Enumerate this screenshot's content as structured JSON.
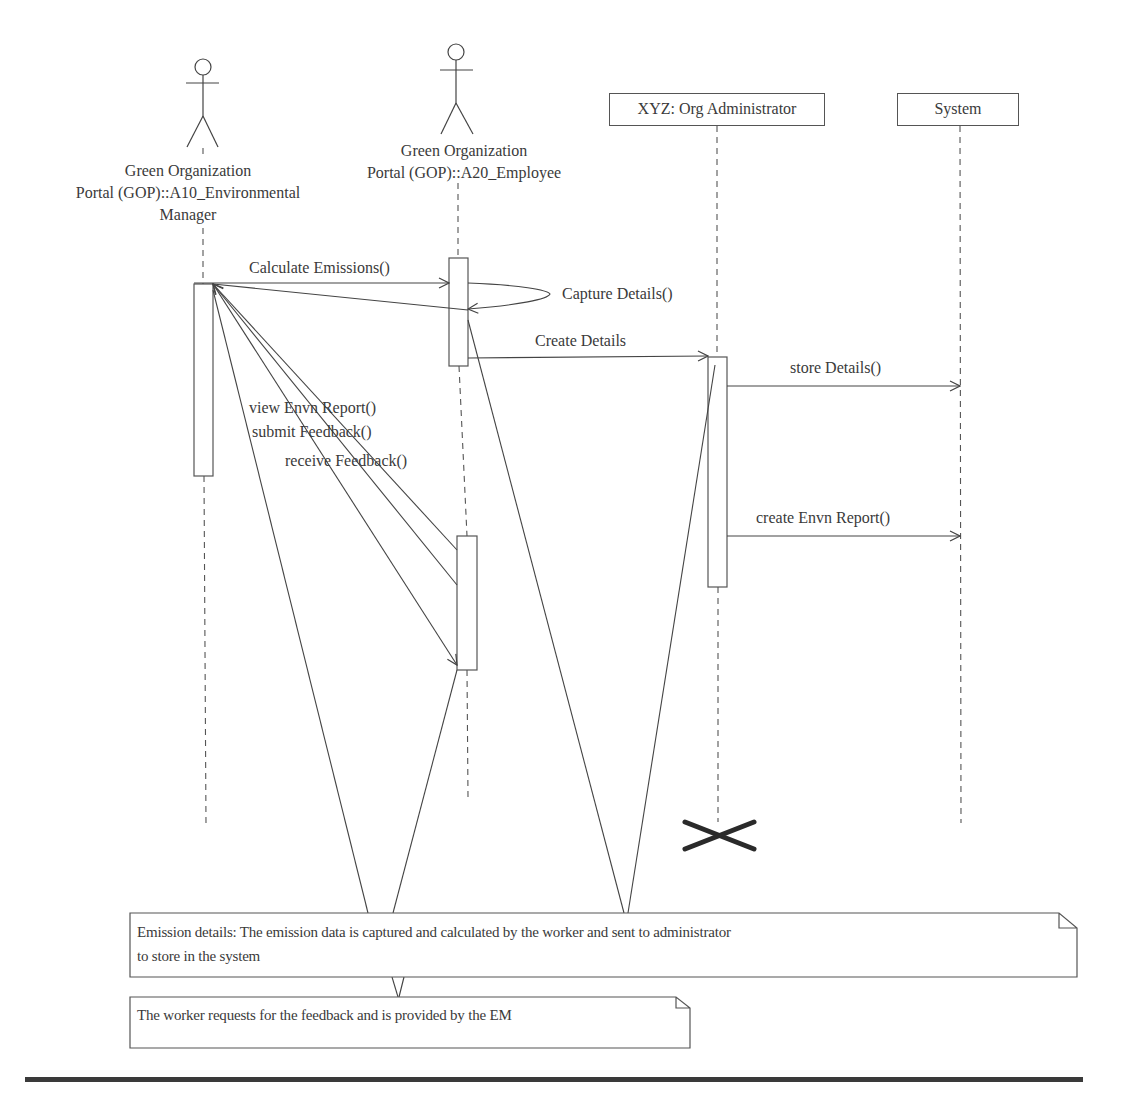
{
  "participants": [
    {
      "id": "env-manager",
      "type": "actor",
      "label_lines": [
        "Green Organization",
        "Portal (GOP)::A10_Environmental",
        "Manager"
      ]
    },
    {
      "id": "employee",
      "type": "actor",
      "label_lines": [
        "Green Organization",
        "Portal (GOP)::A20_Employee"
      ]
    },
    {
      "id": "org-admin",
      "type": "object",
      "label": "XYZ: Org Administrator"
    },
    {
      "id": "system",
      "type": "object",
      "label": "System"
    }
  ],
  "messages": [
    {
      "from": "env-manager",
      "to": "employee",
      "label": "Calculate Emissions()"
    },
    {
      "from": "employee",
      "to": "employee",
      "label": "Capture Details()"
    },
    {
      "from": "employee",
      "to": "org-admin",
      "label": "Create Details"
    },
    {
      "from": "org-admin",
      "to": "system",
      "label": "store Details()"
    },
    {
      "from": "org-admin",
      "to": "system",
      "label": "create Envn Report()"
    },
    {
      "from": "employee",
      "to": "env-manager",
      "label": "view Envn Report()"
    },
    {
      "from": "employee",
      "to": "env-manager",
      "label": "submit Feedback()"
    },
    {
      "from": "env-manager",
      "to": "employee",
      "label": "receive Feedback()"
    }
  ],
  "notes": [
    {
      "id": "note-emission",
      "lines": [
        "Emission details: The emission data is captured and calculated by the worker and sent to administrator",
        "to store in the system"
      ]
    },
    {
      "id": "note-feedback",
      "lines": [
        "The worker requests for the feedback and is provided by the EM"
      ]
    }
  ],
  "destruction": {
    "participant": "org-admin",
    "symbol": "X"
  }
}
